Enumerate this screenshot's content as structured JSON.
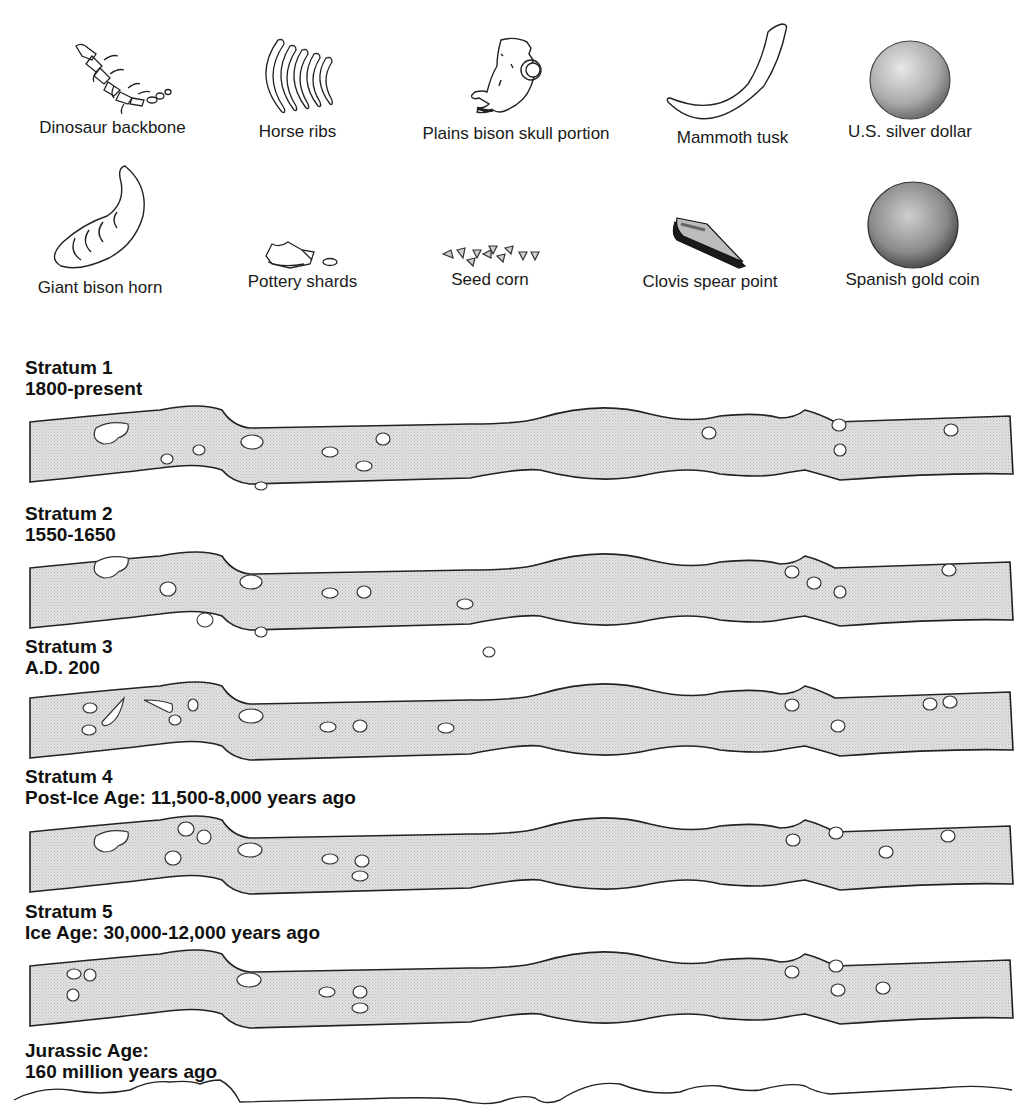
{
  "artifacts": {
    "row1": [
      {
        "label": "Dinosaur backbone",
        "icon": "dinosaur-backbone-icon"
      },
      {
        "label": "Horse ribs",
        "icon": "horse-ribs-icon"
      },
      {
        "label": "Plains bison skull portion",
        "icon": "bison-skull-icon"
      },
      {
        "label": "Mammoth tusk",
        "icon": "mammoth-tusk-icon"
      },
      {
        "label": "U.S. silver dollar",
        "icon": "silver-dollar-icon"
      }
    ],
    "row2": [
      {
        "label": "Giant bison horn",
        "icon": "bison-horn-icon"
      },
      {
        "label": "Pottery shards",
        "icon": "pottery-shards-icon"
      },
      {
        "label": "Seed corn",
        "icon": "seed-corn-icon"
      },
      {
        "label": "Clovis spear point",
        "icon": "clovis-point-icon"
      },
      {
        "label": "Spanish gold coin",
        "icon": "gold-coin-icon"
      }
    ]
  },
  "strata": [
    {
      "title": "Stratum 1",
      "period": "1800-present"
    },
    {
      "title": "Stratum 2",
      "period": "1550-1650"
    },
    {
      "title": "Stratum 3",
      "period": "A.D. 200"
    },
    {
      "title": "Stratum 4",
      "period": "Post-Ice Age: 11,500-8,000 years ago"
    },
    {
      "title": "Stratum 5",
      "period": "Ice Age: 30,000-12,000 years ago"
    }
  ],
  "base_layer": {
    "title": "Jurassic Age:",
    "period": "160 million years ago"
  },
  "colors": {
    "band_fill": "#dcdcdc",
    "outline": "#222222",
    "text": "#111111"
  }
}
